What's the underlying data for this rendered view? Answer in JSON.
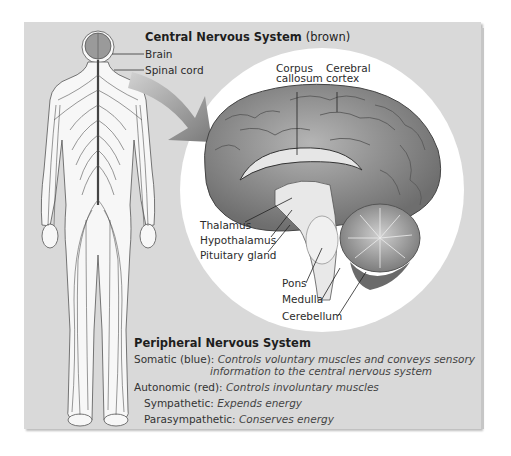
{
  "figure": {
    "cns": {
      "title": "Central Nervous System",
      "title_note": "(brown)",
      "labels": {
        "brain": "Brain",
        "spinal_cord": "Spinal cord"
      }
    },
    "brain_labels": {
      "corpus_callosum_1": "Corpus",
      "corpus_callosum_2": "callosum",
      "cerebral_cortex_1": "Cerebral",
      "cerebral_cortex_2": "cortex",
      "thalamus": "Thalamus",
      "hypothalamus": "Hypothalamus",
      "pituitary_gland": "Pituitary gland",
      "pons": "Pons",
      "medulla": "Medulla",
      "cerebellum": "Cerebellum"
    },
    "pns": {
      "title": "Peripheral Nervous System",
      "somatic_label": "Somatic (blue):",
      "somatic_desc_1": "Controls voluntary muscles and conveys sensory",
      "somatic_desc_2": "information to the central nervous system",
      "autonomic_label": "Autonomic (red):",
      "autonomic_desc": "Controls involuntary muscles",
      "sympathetic_label": "Sympathetic:",
      "sympathetic_desc": "Expends energy",
      "parasympathetic_label": "Parasympathetic:",
      "parasympathetic_desc": "Conserves energy"
    },
    "colors": {
      "panel_bg": "#d9d9d9",
      "circle_bg": "#ffffff",
      "brain_gray": "#8a8a8a",
      "text": "#2b2b2b"
    }
  }
}
